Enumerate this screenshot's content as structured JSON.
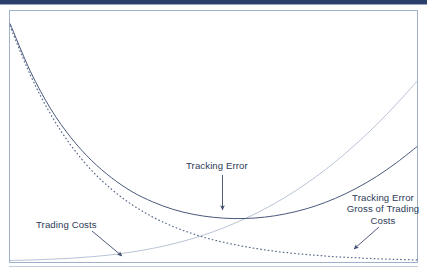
{
  "figure": {
    "name": "tracking-error-vs-trading-costs",
    "background_color": "#ffffff",
    "frame_color": "#9fb0c9",
    "top_bar_color": "#2b3f6b",
    "text_color": "#2f3b57"
  },
  "annotations": {
    "tracking_error": {
      "label": "Tracking Error",
      "arrow": "down-arrow"
    },
    "trading_costs": {
      "label": "Trading Costs",
      "arrow": "down-right-arrow"
    },
    "tracking_error_gross": {
      "label": "Tracking Error\nGross of Trading\nCosts",
      "arrow": "down-left-arrow"
    }
  },
  "chart_data": {
    "type": "line",
    "title": "",
    "subtitle": "",
    "xlabel": "",
    "ylabel": "",
    "xlim": [
      0,
      100
    ],
    "ylim": [
      0,
      100
    ],
    "grid": false,
    "legend": "none",
    "axis_ticks": false,
    "x": [
      0,
      5,
      10,
      15,
      20,
      25,
      30,
      35,
      40,
      45,
      50,
      55,
      60,
      65,
      70,
      75,
      80,
      85,
      90,
      95,
      100
    ],
    "series": [
      {
        "name": "Tracking Error",
        "style": "solid",
        "color": "#49587c",
        "values": [
          95,
          76,
          61,
          49.5,
          40.5,
          33.5,
          28,
          24,
          21,
          19,
          17.8,
          17.3,
          17.5,
          18.4,
          20,
          22.3,
          25.4,
          29.3,
          34,
          39.6,
          46
        ]
      },
      {
        "name": "Tracking Error Gross of Trading Costs",
        "style": "dotted",
        "color": "#5b6a8d",
        "values": [
          94,
          74.5,
          58.8,
          46.4,
          36.6,
          28.9,
          22.8,
          18,
          14.2,
          11.2,
          8.8,
          7,
          5.5,
          4.3,
          3.4,
          2.7,
          2.1,
          1.7,
          1.3,
          1.05,
          0.8
        ]
      },
      {
        "name": "Trading Costs",
        "style": "solid-light",
        "color": "#b9c4d6",
        "values": [
          0.6,
          0.8,
          1.1,
          1.5,
          2.1,
          2.9,
          4.0,
          5.4,
          7.2,
          9.4,
          12.1,
          15.3,
          19.0,
          23.3,
          28.2,
          33.8,
          40.0,
          47.0,
          54.6,
          63.0,
          72.0
        ]
      }
    ]
  }
}
